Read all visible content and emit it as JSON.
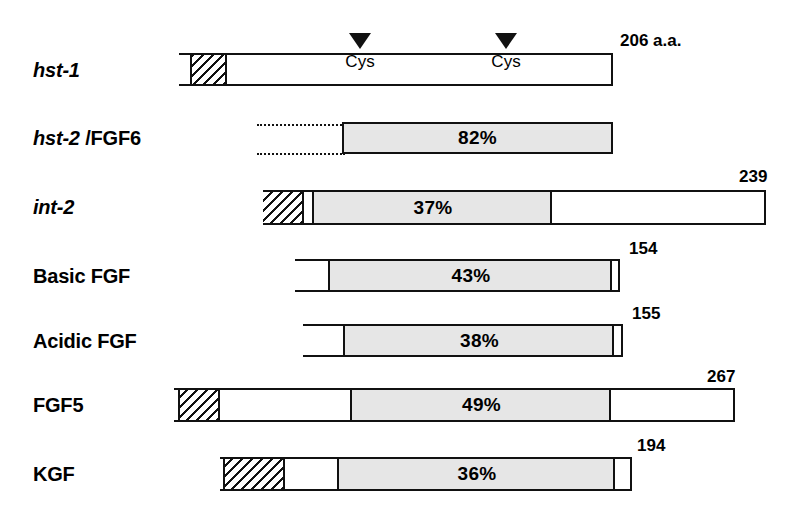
{
  "figure": {
    "reference_protein": "hst-1",
    "reference_length_label": "206 a.a.",
    "cys_markers": [
      {
        "label": "Cys",
        "x": 360
      },
      {
        "label": "Cys",
        "x": 506
      }
    ],
    "rows": [
      {
        "label": "hst-1",
        "label_style": "italic",
        "label_suffix": "",
        "size_label": "206 a.a.",
        "homology": "",
        "bar": {
          "x": 179,
          "y": 53,
          "w": 434,
          "h": 33
        },
        "segments": [
          {
            "type": "white",
            "x": 179,
            "w": 11
          },
          {
            "type": "hatch",
            "x": 190,
            "w": 35
          }
        ],
        "dotted": null
      },
      {
        "label": "hst-2",
        "label_style": "italic",
        "label_suffix": "/FGF6",
        "size_label": "",
        "homology": "82%",
        "bar": {
          "x": 342,
          "y": 122,
          "w": 271,
          "h": 32
        },
        "segments": [
          {
            "type": "gray-full",
            "x": 342,
            "w": 271
          }
        ],
        "dotted": {
          "x": 257,
          "w": 86
        }
      },
      {
        "label": "int-2",
        "label_style": "italic",
        "label_suffix": "",
        "size_label": "239",
        "homology": "37%",
        "bar": {
          "x": 263,
          "y": 190,
          "w": 503,
          "h": 35
        },
        "segments": [
          {
            "type": "hatch",
            "x": 263,
            "w": 39
          },
          {
            "type": "white",
            "x": 302,
            "w": 10
          },
          {
            "type": "gray",
            "x": 312,
            "w": 236
          }
        ],
        "dotted": null
      },
      {
        "label": "Basic FGF",
        "label_style": "bold",
        "label_suffix": "",
        "size_label": "154",
        "homology": "43%",
        "bar": {
          "x": 295,
          "y": 259,
          "w": 325,
          "h": 33
        },
        "segments": [
          {
            "type": "white",
            "x": 295,
            "w": 33
          },
          {
            "type": "gray",
            "x": 328,
            "w": 280
          }
        ],
        "dotted": null
      },
      {
        "label": "Acidic FGF",
        "label_style": "bold",
        "label_suffix": "",
        "size_label": "155",
        "homology": "38%",
        "bar": {
          "x": 303,
          "y": 324,
          "w": 320,
          "h": 33
        },
        "segments": [
          {
            "type": "white",
            "x": 303,
            "w": 40
          },
          {
            "type": "gray",
            "x": 343,
            "w": 267
          }
        ],
        "dotted": null
      },
      {
        "label": "FGF5",
        "label_style": "bold",
        "label_suffix": "",
        "size_label": "267",
        "homology": "49%",
        "bar": {
          "x": 174,
          "y": 388,
          "w": 561,
          "h": 34
        },
        "segments": [
          {
            "type": "hatch",
            "x": 178,
            "w": 40
          },
          {
            "type": "white",
            "x": 218,
            "w": 132
          },
          {
            "type": "gray",
            "x": 350,
            "w": 259
          }
        ],
        "dotted": null
      },
      {
        "label": "KGF",
        "label_style": "bold",
        "label_suffix": "",
        "size_label": "194",
        "homology": "36%",
        "bar": {
          "x": 220,
          "y": 457,
          "w": 412,
          "h": 34
        },
        "segments": [
          {
            "type": "hatch",
            "x": 223,
            "w": 60
          },
          {
            "type": "white",
            "x": 283,
            "w": 54
          },
          {
            "type": "gray",
            "x": 337,
            "w": 276
          }
        ],
        "dotted": null
      }
    ],
    "colors": {
      "outline": "#111111",
      "homology_fill": "#e6e6e6",
      "background": "#ffffff"
    }
  }
}
